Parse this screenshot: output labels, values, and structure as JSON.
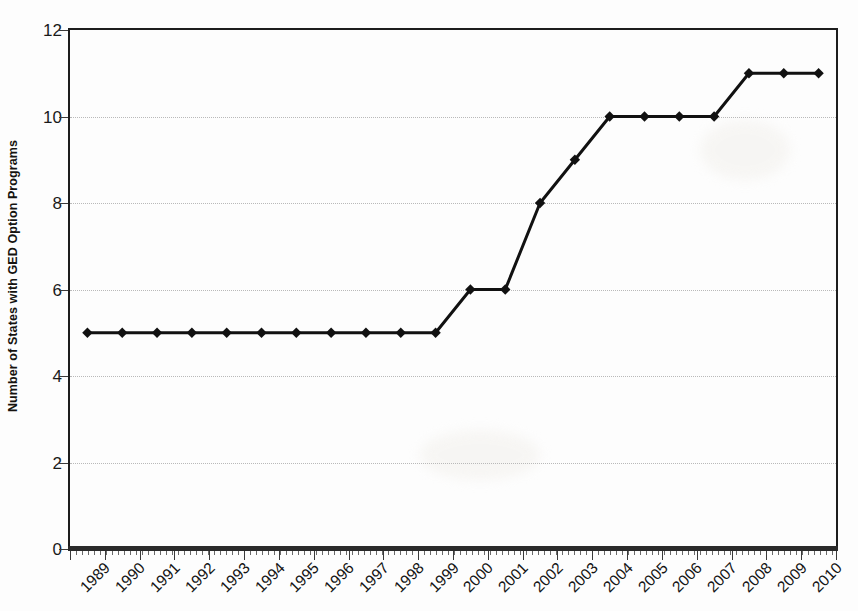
{
  "chart_data": {
    "type": "line",
    "title": "",
    "xlabel": "",
    "ylabel": "Number of States with GED Option Programs",
    "categories": [
      "1989",
      "1990",
      "1991",
      "1992",
      "1993",
      "1994",
      "1995",
      "1996",
      "1997",
      "1998",
      "1999",
      "2000",
      "2001",
      "2002",
      "2003",
      "2004",
      "2005",
      "2006",
      "2007",
      "2008",
      "2009",
      "2010"
    ],
    "values": [
      5,
      5,
      5,
      5,
      5,
      5,
      5,
      5,
      5,
      5,
      5,
      6,
      6,
      8,
      9,
      10,
      10,
      10,
      10,
      11,
      11,
      11
    ],
    "series": [
      {
        "name": "Number of States with GED Option Programs",
        "values": [
          5,
          5,
          5,
          5,
          5,
          5,
          5,
          5,
          5,
          5,
          5,
          6,
          6,
          8,
          9,
          10,
          10,
          10,
          10,
          11,
          11,
          11
        ],
        "marker": "diamond",
        "color": "#111111"
      }
    ],
    "ylim": [
      0,
      12
    ],
    "y_ticks": [
      0,
      2,
      4,
      6,
      8,
      10,
      12
    ],
    "y_tick_labels": [
      "0",
      "2",
      "4",
      "6",
      "8",
      "10",
      "12"
    ],
    "grid": true,
    "grid_style": "dotted",
    "grid_color": "#b9b9b9",
    "legend": "none",
    "x_tick_label_rotation": -45,
    "line_color": "#111111",
    "line_width": 3,
    "marker_color": "#111111",
    "axis_color": "#1d1d1d",
    "background_color": "#fdfdfd"
  }
}
